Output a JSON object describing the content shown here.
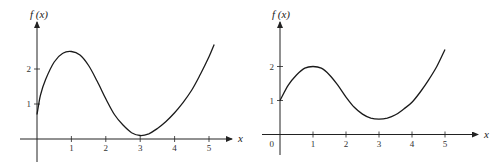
{
  "chart_data": [
    {
      "type": "line",
      "title": "",
      "ylabel": "f (x)",
      "xlabel": "x",
      "xticks": [
        "1",
        "2",
        "3",
        "4",
        "5"
      ],
      "yticks": [
        "1",
        "2"
      ],
      "origin_label": "",
      "xlim": [
        0,
        5.3
      ],
      "ylim": [
        -0.5,
        3.0
      ],
      "grid": false,
      "series": [
        {
          "name": "f(x)",
          "x": [
            0,
            0.1,
            0.25,
            0.5,
            0.75,
            1.0,
            1.25,
            1.5,
            1.75,
            2.0,
            2.25,
            2.5,
            2.75,
            3.0,
            3.25,
            3.5,
            3.75,
            4.0,
            4.25,
            4.5,
            4.75,
            5.0,
            5.15
          ],
          "values": [
            0.7,
            1.25,
            1.7,
            2.2,
            2.45,
            2.5,
            2.4,
            2.1,
            1.65,
            1.15,
            0.7,
            0.4,
            0.18,
            0.1,
            0.15,
            0.3,
            0.5,
            0.75,
            1.05,
            1.4,
            1.85,
            2.35,
            2.7
          ]
        }
      ]
    },
    {
      "type": "line",
      "title": "",
      "ylabel": "f (x)",
      "xlabel": "x",
      "xticks": [
        "1",
        "2",
        "3",
        "4",
        "5"
      ],
      "yticks": [
        "1",
        "2"
      ],
      "origin_label": "0",
      "xlim": [
        0,
        5.3
      ],
      "ylim": [
        -0.5,
        3.0
      ],
      "grid": false,
      "series": [
        {
          "name": "f(x)",
          "x": [
            0,
            0.25,
            0.5,
            0.75,
            1.0,
            1.25,
            1.5,
            1.75,
            2.0,
            2.25,
            2.5,
            2.75,
            3.0,
            3.25,
            3.5,
            3.75,
            4.0,
            4.25,
            4.5,
            4.75,
            5.0
          ],
          "values": [
            1.0,
            1.45,
            1.75,
            1.95,
            2.0,
            1.95,
            1.75,
            1.45,
            1.1,
            0.8,
            0.6,
            0.48,
            0.45,
            0.48,
            0.58,
            0.75,
            0.95,
            1.25,
            1.6,
            2.0,
            2.5
          ]
        }
      ]
    }
  ]
}
